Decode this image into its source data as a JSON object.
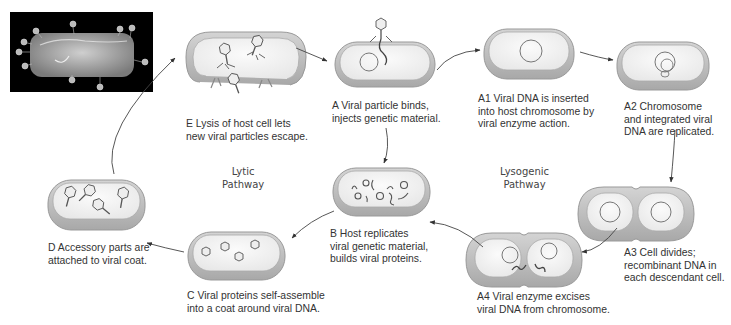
{
  "diagram": {
    "type": "cycle",
    "pathways": {
      "lytic": {
        "label": "Lytic\nPathway"
      },
      "lysogenic": {
        "label": "Lysogenic\nPathway"
      }
    },
    "photo": {
      "description": "Electron micrograph of bacterium with attached phages"
    },
    "steps": {
      "A": {
        "label": "A",
        "text": "A Viral particle binds,\ninjects genetic material."
      },
      "A1": {
        "label": "A1",
        "text": "A1 Viral DNA is inserted\ninto host chromosome by\nviral enzyme action."
      },
      "A2": {
        "label": "A2",
        "text": "A2 Chromosome\nand integrated viral\nDNA are replicated."
      },
      "A3": {
        "label": "A3",
        "text": "A3 Cell divides;\nrecombinant DNA in\neach descendant cell."
      },
      "A4": {
        "label": "A4",
        "text": "A4 Viral enzyme excises\nviral DNA from chromosome."
      },
      "B": {
        "label": "B",
        "text": "B Host replicates\nviral genetic material,\nbuilds viral proteins."
      },
      "C": {
        "label": "C",
        "text": "C Viral proteins self-assemble\ninto a coat around viral DNA."
      },
      "D": {
        "label": "D",
        "text": "D Accessory parts are\nattached to viral coat."
      },
      "E": {
        "label": "E",
        "text": "E Lysis of host cell lets\nnew viral particles escape."
      }
    },
    "flow": [
      [
        "A",
        "A1"
      ],
      [
        "A1",
        "A2"
      ],
      [
        "A2",
        "A3"
      ],
      [
        "A3",
        "A4"
      ],
      [
        "A4",
        "B"
      ],
      [
        "A",
        "B"
      ],
      [
        "B",
        "C"
      ],
      [
        "C",
        "D"
      ],
      [
        "D",
        "E"
      ],
      [
        "E",
        "A"
      ]
    ],
    "colors": {
      "cell_fill": "#f2f2f2",
      "cell_rim": "#bdbdbd",
      "cell_shadow": "#9a9a9a",
      "line": "#444444",
      "text": "#333333",
      "photo_bg": "#000000"
    }
  }
}
